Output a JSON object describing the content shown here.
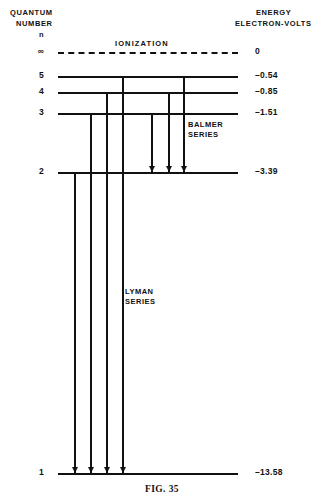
{
  "figure": {
    "caption": "FIG. 35",
    "ionization_label": "IONIZATION"
  },
  "headers": {
    "quantum_line1": "QUANTUM",
    "quantum_line2": "NUMBER",
    "quantum_symbol": "n",
    "energy_line1": "ENERGY",
    "energy_line2": "ELECTRON-VOLTS"
  },
  "series": {
    "balmer_line1": "BALMER",
    "balmer_line2": "SERIES",
    "lyman_line1": "LYMAN",
    "lyman_line2": "SERIES"
  },
  "colors": {
    "ink": "#111111",
    "paper": "#ffffff"
  },
  "chart_data": {
    "type": "diagram",
    "title": "FIG. 35",
    "subtitle": "Hydrogen atom energy level diagram",
    "xlabel": "",
    "ylabel": "ENERGY ELECTRON-VOLTS",
    "grid": false,
    "legend": "none",
    "levels": [
      {
        "n": "∞",
        "energy": "0",
        "energy_value": 0,
        "y": 52,
        "style": "dashed"
      },
      {
        "n": "5",
        "energy": "–0.54",
        "energy_value": -0.54,
        "y": 76,
        "style": "solid"
      },
      {
        "n": "4",
        "energy": "–0.85",
        "energy_value": -0.85,
        "y": 92,
        "style": "solid"
      },
      {
        "n": "3",
        "energy": "–1.51",
        "energy_value": -1.51,
        "y": 113,
        "style": "solid"
      },
      {
        "n": "2",
        "energy": "–3.39",
        "energy_value": -3.39,
        "y": 172,
        "style": "solid"
      },
      {
        "n": "1",
        "energy": "–13.58",
        "energy_value": -13.58,
        "y": 473,
        "style": "solid"
      }
    ],
    "transitions": [
      {
        "series": "Lyman",
        "from_n": "2",
        "to_n": "1",
        "x": 74,
        "y_top": 172,
        "y_bottom": 473
      },
      {
        "series": "Lyman",
        "from_n": "3",
        "to_n": "1",
        "x": 90,
        "y_top": 113,
        "y_bottom": 473
      },
      {
        "series": "Lyman",
        "from_n": "4",
        "to_n": "1",
        "x": 106,
        "y_top": 92,
        "y_bottom": 473
      },
      {
        "series": "Lyman",
        "from_n": "5",
        "to_n": "1",
        "x": 122,
        "y_top": 76,
        "y_bottom": 473
      },
      {
        "series": "Balmer",
        "from_n": "3",
        "to_n": "2",
        "x": 151,
        "y_top": 113,
        "y_bottom": 172
      },
      {
        "series": "Balmer",
        "from_n": "4",
        "to_n": "2",
        "x": 168,
        "y_top": 92,
        "y_bottom": 172
      },
      {
        "series": "Balmer",
        "from_n": "5",
        "to_n": "2",
        "x": 183,
        "y_top": 76,
        "y_bottom": 172
      }
    ]
  }
}
